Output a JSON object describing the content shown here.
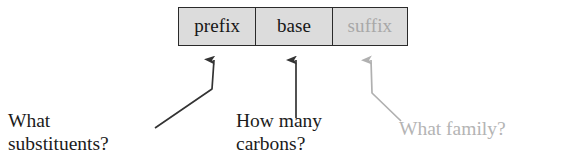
{
  "diagram": {
    "box": {
      "cells": [
        {
          "label": "prefix",
          "tone": "dark"
        },
        {
          "label": "base",
          "tone": "dark"
        },
        {
          "label": "suffix",
          "tone": "gray"
        }
      ]
    },
    "annotations": [
      {
        "id": "substituents",
        "text": "What\nsubstituents?",
        "tone": "dark",
        "points_to": "prefix"
      },
      {
        "id": "carbons",
        "text": "How many\ncarbons?",
        "tone": "dark",
        "points_to": "base"
      },
      {
        "id": "family",
        "text": "What family?",
        "tone": "gray",
        "points_to": "suffix"
      }
    ],
    "arrows": [
      {
        "id": "arrow-to-prefix",
        "tone": "dark",
        "shape": "bent-left"
      },
      {
        "id": "arrow-to-base",
        "tone": "dark",
        "shape": "straight"
      },
      {
        "id": "arrow-to-suffix",
        "tone": "gray",
        "shape": "bent-right"
      }
    ],
    "colors": {
      "box_fill": "#dcdcdc",
      "box_border": "#2a2a2a",
      "text_dark": "#161616",
      "text_gray": "#a8a8a8",
      "arrow_dark": "#333333",
      "arrow_gray": "#b0b0b0",
      "background": "#ffffff"
    }
  }
}
